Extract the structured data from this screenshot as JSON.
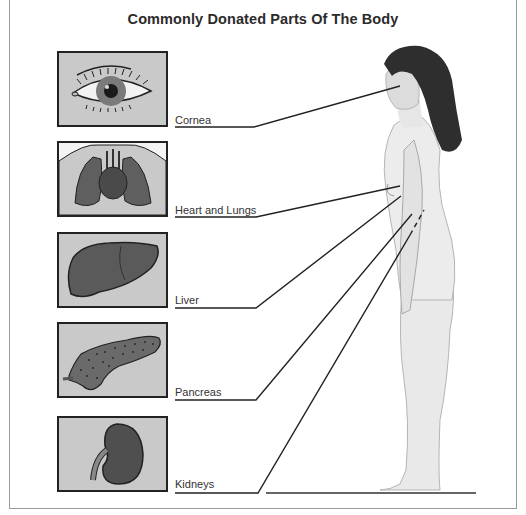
{
  "title": "Commonly Donated Parts Of The Body",
  "organs": [
    {
      "id": "cornea",
      "label": "Cornea",
      "icon": "eye-icon"
    },
    {
      "id": "heart-lungs",
      "label": "Heart and Lungs",
      "icon": "heart-lungs-icon"
    },
    {
      "id": "liver",
      "label": "Liver",
      "icon": "liver-icon"
    },
    {
      "id": "pancreas",
      "label": "Pancreas",
      "icon": "pancreas-icon"
    },
    {
      "id": "kidneys",
      "label": "Kidneys",
      "icon": "kidney-icon"
    }
  ],
  "figure": "standing-human-profile",
  "colors": {
    "panel_bg": "#c9c9c9",
    "organ_fill": "#5a5a5a",
    "line": "#222222",
    "frame": "#9a9a9a"
  }
}
